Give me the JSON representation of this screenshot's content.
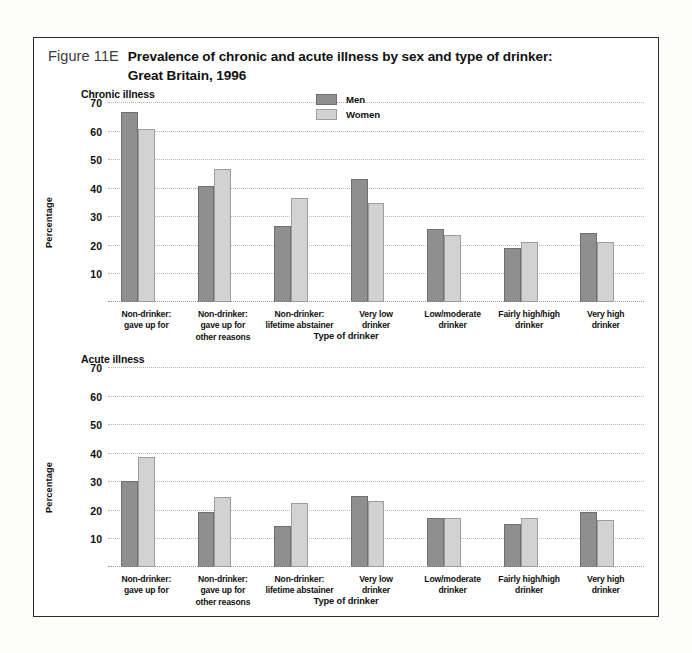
{
  "figure": {
    "number": "Figure 11E",
    "title_line1": "Prevalence of chronic and acute illness by sex and type of drinker:",
    "title_line2": "Great Britain, 1996"
  },
  "legend": {
    "men_label": "Men",
    "women_label": "Women",
    "men_color": "#8f8f8f",
    "women_color": "#d2d2d2"
  },
  "chart_data": [
    {
      "type": "bar",
      "title": "Chronic illness",
      "xlabel": "Type of drinker",
      "ylabel": "Percentage",
      "ylim": [
        0,
        70
      ],
      "yticks": [
        10,
        20,
        30,
        40,
        50,
        60,
        70
      ],
      "grid": true,
      "legend_position": "top-center",
      "categories": [
        "Non-drinker:\ngave up for",
        "Non-drinker:\ngave up for\nother reasons",
        "Non-drinker:\nlifetime abstainer",
        "Very low\ndrinker",
        "Low/moderate\ndrinker",
        "Fairly high/high\ndrinker",
        "Very high\ndrinker"
      ],
      "categories_lines": [
        [
          "Non-drinker:",
          "gave up for"
        ],
        [
          "Non-drinker:",
          "gave up for",
          "other reasons"
        ],
        [
          "Non-drinker:",
          "lifetime abstainer"
        ],
        [
          "Very low",
          "drinker"
        ],
        [
          "Low/moderate",
          "drinker"
        ],
        [
          "Fairly high/high",
          "drinker"
        ],
        [
          "Very high",
          "drinker"
        ]
      ],
      "series": [
        {
          "name": "Men",
          "values": [
            66.5,
            40.5,
            26.5,
            43.0,
            25.5,
            19.0,
            24.0
          ]
        },
        {
          "name": "Women",
          "values": [
            60.5,
            46.5,
            36.5,
            34.5,
            23.5,
            21.0,
            21.0
          ]
        }
      ]
    },
    {
      "type": "bar",
      "title": "Acute illness",
      "xlabel": "Type of drinker",
      "ylabel": "Percentage",
      "ylim": [
        0,
        70
      ],
      "yticks": [
        10,
        20,
        30,
        40,
        50,
        60,
        70
      ],
      "grid": true,
      "legend_position": "none",
      "categories": [
        "Non-drinker:\ngave up for",
        "Non-drinker:\ngave up for\nother reasons",
        "Non-drinker:\nlifetime abstainer",
        "Very low\ndrinker",
        "Low/moderate\ndrinker",
        "Fairly high/high\ndrinker",
        "Very high\ndrinker"
      ],
      "categories_lines": [
        [
          "Non-drinker:",
          "gave up for"
        ],
        [
          "Non-drinker:",
          "gave up for",
          "other reasons"
        ],
        [
          "Non-drinker:",
          "lifetime abstainer"
        ],
        [
          "Very low",
          "drinker"
        ],
        [
          "Low/moderate",
          "drinker"
        ],
        [
          "Fairly high/high",
          "drinker"
        ],
        [
          "Very high",
          "drinker"
        ]
      ],
      "series": [
        {
          "name": "Men",
          "values": [
            30.2,
            19.3,
            14.5,
            25.0,
            17.0,
            15.0,
            19.3
          ]
        },
        {
          "name": "Women",
          "values": [
            38.5,
            24.5,
            22.5,
            23.0,
            17.0,
            17.3,
            16.3
          ]
        }
      ]
    }
  ]
}
